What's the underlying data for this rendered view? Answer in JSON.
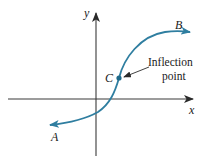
{
  "diagram": {
    "type": "function-graph",
    "axes": {
      "x_label": "x",
      "y_label": "y"
    },
    "curve": {
      "start_label": "A",
      "end_label": "B",
      "point_label": "C",
      "color": "#2f7ea0"
    },
    "annotation": {
      "line1": "Inflection",
      "line2": "point"
    },
    "colors": {
      "axis": "#3a3a3a",
      "curve": "#2f7ea0",
      "text": "#1a1a1a"
    }
  }
}
